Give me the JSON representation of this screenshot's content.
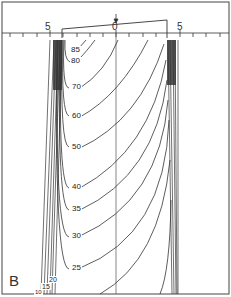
{
  "figure": {
    "panel_label": "B",
    "axis": {
      "tick_labels": [
        {
          "text": "5",
          "x": 45,
          "y": 22
        },
        {
          "text": "0",
          "x": 112,
          "y": 22
        },
        {
          "text": "5",
          "x": 177,
          "y": 22
        }
      ]
    },
    "contour_labels": [
      {
        "text": "85",
        "x": 70,
        "y": 46
      },
      {
        "text": "80",
        "x": 70,
        "y": 57
      },
      {
        "text": "70",
        "x": 71,
        "y": 83
      },
      {
        "text": "60",
        "x": 71,
        "y": 112
      },
      {
        "text": "50",
        "x": 71,
        "y": 143
      },
      {
        "text": "40",
        "x": 71,
        "y": 183
      },
      {
        "text": "35",
        "x": 71,
        "y": 205
      },
      {
        "text": "30",
        "x": 71,
        "y": 232
      },
      {
        "text": "25",
        "x": 71,
        "y": 264
      },
      {
        "text": "20",
        "x": 48,
        "y": 276
      },
      {
        "text": "15",
        "x": 41,
        "y": 283
      },
      {
        "text": "10",
        "x": 34,
        "y": 289
      }
    ],
    "colors": {
      "line": "#333333",
      "dense": "#444444",
      "background": "#ffffff"
    }
  }
}
